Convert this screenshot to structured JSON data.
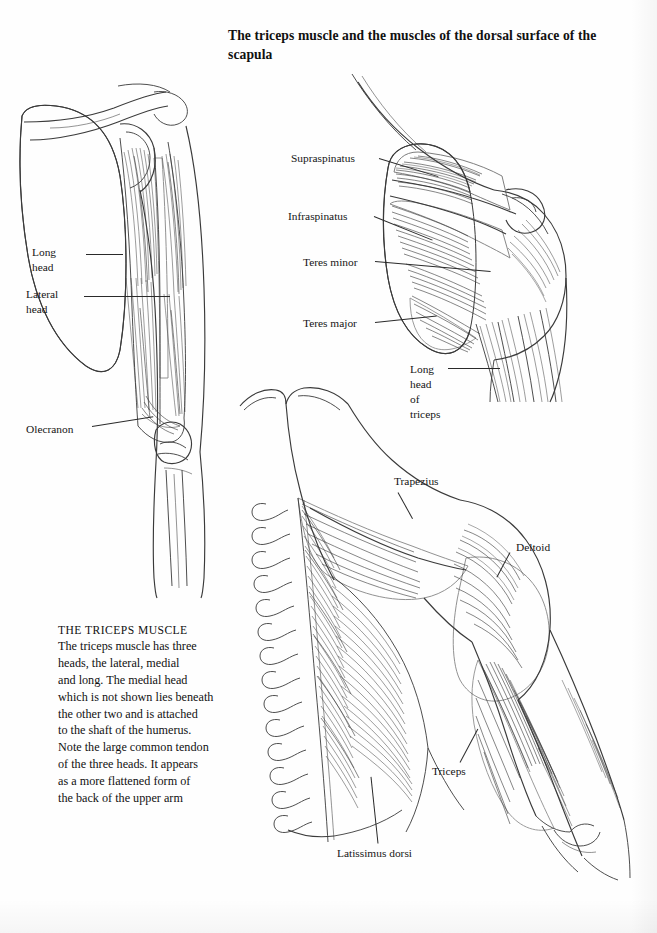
{
  "page": {
    "title": "The triceps muscle and the muscles of the dorsal surface of the scapula",
    "background_color": "#fefefe",
    "ink_color": "#333333"
  },
  "caption": {
    "heading": "THE TRICEPS MUSCLE",
    "body": "The triceps muscle has three\nheads, the lateral, medial\nand long. The medial head\nwhich is not shown lies beneath\nthe other two and is attached\nto the shaft of the humerus.\nNote the large common tendon\nof the three heads. It appears\nas a more flattened form of\nthe back of the upper arm"
  },
  "figures": [
    {
      "id": "posterior-arm-scapula",
      "name": "Posterior view of scapula and triceps of the arm",
      "labels": [
        {
          "text": "Long\nhead",
          "name": "label-long-head"
        },
        {
          "text": "Lateral\nhead",
          "name": "label-lateral-head"
        },
        {
          "text": "Olecranon",
          "name": "label-olecranon"
        }
      ]
    },
    {
      "id": "dorsal-scapula-muscles",
      "name": "Dorsal surface of the scapula showing rotator cuff muscles",
      "labels": [
        {
          "text": "Supraspinatus",
          "name": "label-supraspinatus"
        },
        {
          "text": "Infraspinatus",
          "name": "label-infraspinatus"
        },
        {
          "text": "Teres minor",
          "name": "label-teres-minor"
        },
        {
          "text": "Teres major",
          "name": "label-teres-major"
        },
        {
          "text": "Long\nhead\nof\ntriceps",
          "name": "label-long-head-of-triceps"
        }
      ]
    },
    {
      "id": "back-and-arm",
      "name": "Posterior view of the back, shoulder and upper arm",
      "labels": [
        {
          "text": "Trapezius",
          "name": "label-trapezius"
        },
        {
          "text": "Deltoid",
          "name": "label-deltoid"
        },
        {
          "text": "Triceps",
          "name": "label-triceps"
        },
        {
          "text": "Latissimus dorsi",
          "name": "label-latissimus-dorsi"
        }
      ]
    }
  ],
  "labels": {
    "long_head": "Long\nhead",
    "lateral_head": "Lateral\nhead",
    "olecranon": "Olecranon",
    "supraspinatus": "Supraspinatus",
    "infraspinatus": "Infraspinatus",
    "teres_minor": "Teres minor",
    "teres_major": "Teres major",
    "long_head_of_triceps": "Long\nhead\nof\ntriceps",
    "trapezius": "Trapezius",
    "deltoid": "Deltoid",
    "triceps": "Triceps",
    "latissimus_dorsi": "Latissimus dorsi"
  }
}
